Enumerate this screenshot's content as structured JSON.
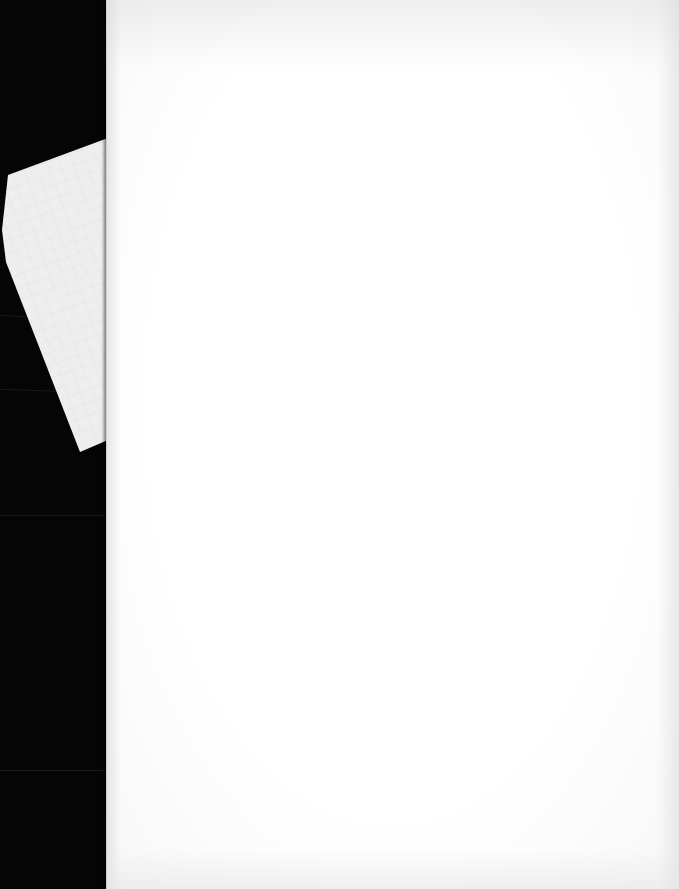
{
  "scene": {
    "description": "Blank white sheet of paper photographed on a dark background, with a fragment of grid paper visible behind its left edge",
    "background_color": "#050505",
    "sheet_color": "#ffffff",
    "grid_paper_color": "#eeeeee",
    "grid_line_color": "#d8d8d8",
    "text_content": []
  }
}
